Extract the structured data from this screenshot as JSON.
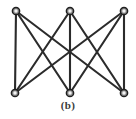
{
  "figure": {
    "caption": "(b)",
    "label": "(b)",
    "background_color": "#ffffff",
    "edge_color": "#2b2b2b",
    "vertex_fill_color": "#f2f2f2",
    "vertex_stroke_color": "#202020",
    "canvas": {
      "width": 136,
      "height": 119
    }
  },
  "graph_data": {
    "type": "graph",
    "name": "K3,3",
    "vertex_count": 6,
    "edge_count": 9,
    "bipartite": true,
    "vertices": [
      {
        "id": "t1",
        "row": "top",
        "x": 16,
        "y": 11,
        "r": 3.6
      },
      {
        "id": "t2",
        "row": "top",
        "x": 70,
        "y": 11,
        "r": 3.6
      },
      {
        "id": "t3",
        "row": "top",
        "x": 124,
        "y": 11,
        "r": 3.6
      },
      {
        "id": "b1",
        "row": "bottom",
        "x": 15,
        "y": 93,
        "r": 3.6
      },
      {
        "id": "b2",
        "row": "bottom",
        "x": 70,
        "y": 93,
        "r": 3.6
      },
      {
        "id": "b3",
        "row": "bottom",
        "x": 124,
        "y": 93,
        "r": 3.6
      }
    ],
    "edges": [
      {
        "from": "t1",
        "to": "b1"
      },
      {
        "from": "t1",
        "to": "b2"
      },
      {
        "from": "t1",
        "to": "b3"
      },
      {
        "from": "t2",
        "to": "b1"
      },
      {
        "from": "t2",
        "to": "b2"
      },
      {
        "from": "t2",
        "to": "b3"
      },
      {
        "from": "t3",
        "to": "b1"
      },
      {
        "from": "t3",
        "to": "b2"
      },
      {
        "from": "t3",
        "to": "b3"
      }
    ]
  }
}
